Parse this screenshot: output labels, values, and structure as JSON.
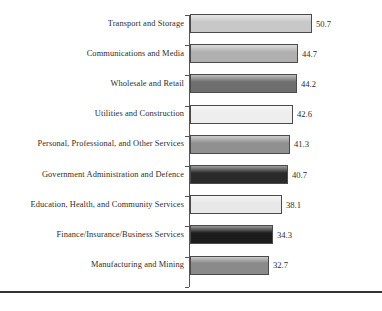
{
  "chart_data": {
    "type": "bar",
    "orientation": "horizontal",
    "title": "",
    "subtitle": "",
    "xlabel": "",
    "ylabel": "",
    "xlim": [
      0,
      56
    ],
    "grid": false,
    "legend": null,
    "categories": [
      "Transport and Storage",
      "Communications and Media",
      "Wholesale and  Retail",
      "Utilities and Construction",
      "Personal, Professional, and Other Services",
      "Government Administration and Defence",
      "Education, Health, and Community Services",
      "Finance/Insurance/Business Services",
      "Manufacturing and Mining"
    ],
    "values": [
      50.7,
      44.7,
      44.2,
      42.6,
      41.3,
      40.7,
      38.1,
      34.3,
      32.7
    ],
    "value_labels": [
      "50.7",
      "44.7",
      "44.2",
      "42.6",
      "41.3",
      "40.7",
      "38.1",
      "34.3",
      "32.7"
    ],
    "bar_colors": [
      "#c8c8c8",
      "#b0b0b0",
      "#6e6e6e",
      "#eeeeee",
      "#909090",
      "#2b2b2b",
      "#e8e8e8",
      "#1c1c1c",
      "#8a8a8a"
    ],
    "bar_border_color": "#4a4a4a",
    "axis_color": "#555555",
    "rule_color": "#333333",
    "background": "#ffffff"
  }
}
